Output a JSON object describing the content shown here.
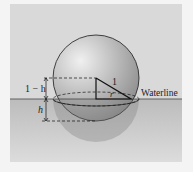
{
  "diagram": {
    "labels": {
      "upper_segment": "1 − h",
      "lower_segment": "h",
      "hypotenuse": "1",
      "radius": "r",
      "waterline": "Waterline"
    },
    "colors": {
      "background": "#d9d9d9",
      "water": "#b8b8b8",
      "sphere_light": "#e6e6e6",
      "sphere_dark": "#8e8e8e",
      "line": "#1a1a1a"
    }
  }
}
